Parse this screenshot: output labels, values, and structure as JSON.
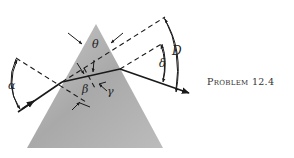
{
  "figure": {
    "caption": "Problem 12.4",
    "labels": {
      "theta": "θ",
      "alpha": "α",
      "beta": "β",
      "gamma": "γ",
      "delta": "δ",
      "D": "D"
    },
    "colors": {
      "prism_light": "#bdbdbd",
      "prism_dark": "#9a9a9a",
      "ray": "#1a1a1a",
      "background": "#ffffff"
    }
  }
}
